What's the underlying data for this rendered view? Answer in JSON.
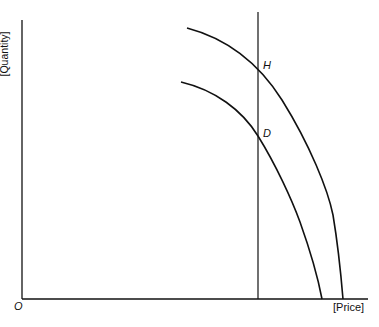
{
  "diagram": {
    "axes": {
      "y_label": "[Quantity]",
      "x_label": "[Price]",
      "origin_label": "O"
    },
    "points": [
      {
        "name": "H",
        "label": "H"
      },
      {
        "name": "D",
        "label": "D"
      }
    ],
    "curves": [
      "outer-curve",
      "inner-curve"
    ],
    "vertical_line": "price-line",
    "colors": {
      "line": "#111111",
      "background": "#ffffff"
    }
  }
}
